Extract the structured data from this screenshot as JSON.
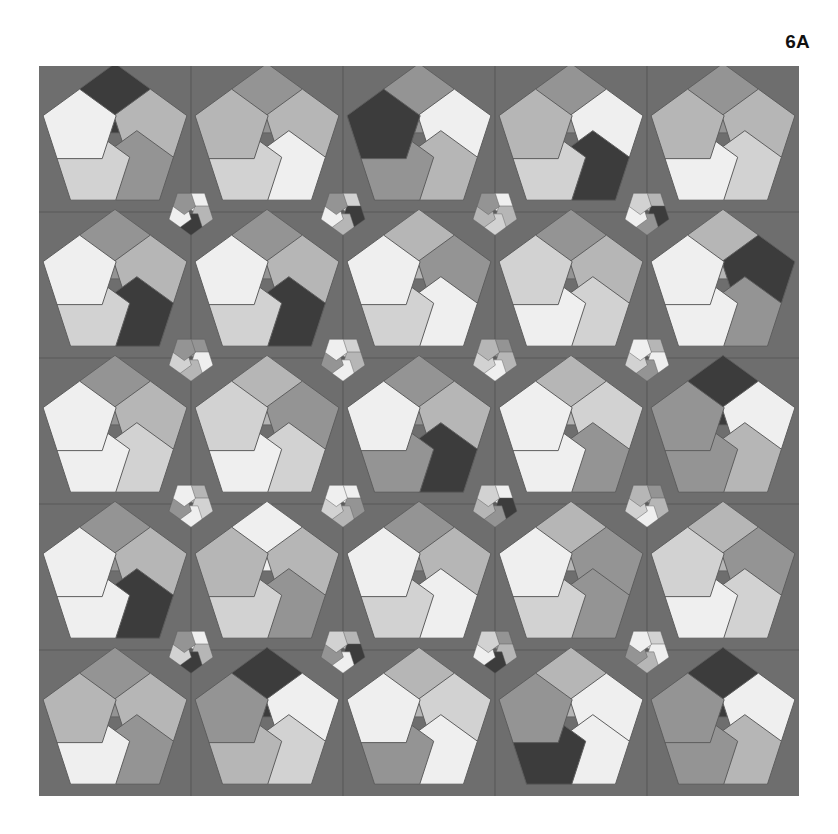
{
  "figure": {
    "label": "6A",
    "title": "6A"
  },
  "canvas": {
    "width": 838,
    "height": 834,
    "page_background": "#ffffff"
  },
  "tiling": {
    "name": "pentagon-rosette-tiling",
    "plate_background": "#6e6e6e",
    "grid_line_color": "#585858",
    "edge_color": "#5d5d5d",
    "origin_x": 39,
    "origin_y": 66,
    "plate_width": 760,
    "plate_height": 730,
    "grid_cols": 5,
    "grid_rows": 5,
    "cell_width": 152,
    "cell_height": 146,
    "large_rosette_radius": 62,
    "small_rosette_radius": 19,
    "pentagons_per_rosette": 5,
    "rosette_angle_step_deg": 72,
    "palette": {
      "near_black": "#3c3c3c",
      "dark_gray": "#7e7e7e",
      "mid_gray": "#949494",
      "light_gray": "#b6b6b6",
      "pale_gray": "#d2d2d2",
      "near_white": "#efefef"
    },
    "color_keys": [
      "near_black",
      "dark_gray",
      "mid_gray",
      "light_gray",
      "pale_gray",
      "near_white"
    ],
    "large_rosettes": [
      {
        "row": 0,
        "col": 0,
        "rotation": 0,
        "colors": [
          "near_black",
          "light_gray",
          "mid_gray",
          "pale_gray",
          "near_white"
        ]
      },
      {
        "row": 0,
        "col": 1,
        "rotation": 0,
        "colors": [
          "mid_gray",
          "light_gray",
          "near_white",
          "pale_gray",
          "light_gray"
        ]
      },
      {
        "row": 0,
        "col": 2,
        "rotation": 0,
        "colors": [
          "mid_gray",
          "near_white",
          "light_gray",
          "mid_gray",
          "near_black"
        ]
      },
      {
        "row": 0,
        "col": 3,
        "rotation": 0,
        "colors": [
          "mid_gray",
          "near_white",
          "near_black",
          "pale_gray",
          "light_gray"
        ]
      },
      {
        "row": 0,
        "col": 4,
        "rotation": 0,
        "colors": [
          "mid_gray",
          "light_gray",
          "pale_gray",
          "near_white",
          "light_gray"
        ]
      },
      {
        "row": 1,
        "col": 0,
        "rotation": 0,
        "colors": [
          "mid_gray",
          "light_gray",
          "near_black",
          "pale_gray",
          "near_white"
        ]
      },
      {
        "row": 1,
        "col": 1,
        "rotation": 0,
        "colors": [
          "mid_gray",
          "light_gray",
          "near_black",
          "pale_gray",
          "near_white"
        ]
      },
      {
        "row": 1,
        "col": 2,
        "rotation": 0,
        "colors": [
          "light_gray",
          "mid_gray",
          "near_white",
          "pale_gray",
          "near_white"
        ]
      },
      {
        "row": 1,
        "col": 3,
        "rotation": 0,
        "colors": [
          "mid_gray",
          "light_gray",
          "pale_gray",
          "near_white",
          "pale_gray"
        ]
      },
      {
        "row": 1,
        "col": 4,
        "rotation": 0,
        "colors": [
          "light_gray",
          "near_black",
          "mid_gray",
          "near_white",
          "near_white"
        ]
      },
      {
        "row": 2,
        "col": 0,
        "rotation": 0,
        "colors": [
          "mid_gray",
          "light_gray",
          "pale_gray",
          "near_white",
          "near_white"
        ]
      },
      {
        "row": 2,
        "col": 1,
        "rotation": 0,
        "colors": [
          "light_gray",
          "mid_gray",
          "pale_gray",
          "near_white",
          "pale_gray"
        ]
      },
      {
        "row": 2,
        "col": 2,
        "rotation": 0,
        "colors": [
          "mid_gray",
          "light_gray",
          "near_black",
          "mid_gray",
          "near_white"
        ]
      },
      {
        "row": 2,
        "col": 3,
        "rotation": 0,
        "colors": [
          "light_gray",
          "pale_gray",
          "mid_gray",
          "near_white",
          "near_white"
        ]
      },
      {
        "row": 2,
        "col": 4,
        "rotation": 0,
        "colors": [
          "near_black",
          "near_white",
          "light_gray",
          "mid_gray",
          "mid_gray"
        ]
      },
      {
        "row": 3,
        "col": 0,
        "rotation": 0,
        "colors": [
          "mid_gray",
          "light_gray",
          "near_black",
          "near_white",
          "near_white"
        ]
      },
      {
        "row": 3,
        "col": 1,
        "rotation": 0,
        "colors": [
          "near_white",
          "light_gray",
          "mid_gray",
          "pale_gray",
          "light_gray"
        ]
      },
      {
        "row": 3,
        "col": 2,
        "rotation": 0,
        "colors": [
          "mid_gray",
          "light_gray",
          "near_white",
          "pale_gray",
          "near_white"
        ]
      },
      {
        "row": 3,
        "col": 3,
        "rotation": 0,
        "colors": [
          "light_gray",
          "mid_gray",
          "mid_gray",
          "pale_gray",
          "near_white"
        ]
      },
      {
        "row": 3,
        "col": 4,
        "rotation": 0,
        "colors": [
          "light_gray",
          "mid_gray",
          "pale_gray",
          "near_white",
          "pale_gray"
        ]
      },
      {
        "row": 4,
        "col": 0,
        "rotation": 0,
        "colors": [
          "mid_gray",
          "light_gray",
          "mid_gray",
          "near_white",
          "light_gray"
        ]
      },
      {
        "row": 4,
        "col": 1,
        "rotation": 0,
        "colors": [
          "near_black",
          "near_white",
          "pale_gray",
          "light_gray",
          "mid_gray"
        ]
      },
      {
        "row": 4,
        "col": 2,
        "rotation": 0,
        "colors": [
          "light_gray",
          "pale_gray",
          "near_white",
          "mid_gray",
          "near_white"
        ]
      },
      {
        "row": 4,
        "col": 3,
        "rotation": 0,
        "colors": [
          "light_gray",
          "near_white",
          "near_white",
          "near_black",
          "mid_gray"
        ]
      },
      {
        "row": 4,
        "col": 4,
        "rotation": 0,
        "colors": [
          "near_black",
          "near_white",
          "light_gray",
          "mid_gray",
          "mid_gray"
        ]
      }
    ],
    "small_rosettes": [
      {
        "row": 0,
        "col": 0,
        "rotation": 36,
        "colors": [
          "near_white",
          "light_gray",
          "near_black",
          "near_white",
          "mid_gray"
        ]
      },
      {
        "row": 0,
        "col": 1,
        "rotation": 36,
        "colors": [
          "pale_gray",
          "near_black",
          "light_gray",
          "near_white",
          "mid_gray"
        ]
      },
      {
        "row": 0,
        "col": 2,
        "rotation": 36,
        "colors": [
          "near_white",
          "light_gray",
          "pale_gray",
          "light_gray",
          "mid_gray"
        ]
      },
      {
        "row": 0,
        "col": 3,
        "rotation": 36,
        "colors": [
          "light_gray",
          "near_black",
          "mid_gray",
          "near_white",
          "pale_gray"
        ]
      },
      {
        "row": 1,
        "col": 0,
        "rotation": 36,
        "colors": [
          "mid_gray",
          "near_white",
          "light_gray",
          "pale_gray",
          "mid_gray"
        ]
      },
      {
        "row": 1,
        "col": 1,
        "rotation": 36,
        "colors": [
          "pale_gray",
          "light_gray",
          "near_white",
          "mid_gray",
          "near_white"
        ]
      },
      {
        "row": 1,
        "col": 2,
        "rotation": 36,
        "colors": [
          "mid_gray",
          "light_gray",
          "near_white",
          "pale_gray",
          "light_gray"
        ]
      },
      {
        "row": 1,
        "col": 3,
        "rotation": 36,
        "colors": [
          "light_gray",
          "near_white",
          "mid_gray",
          "pale_gray",
          "near_white"
        ]
      },
      {
        "row": 2,
        "col": 0,
        "rotation": 36,
        "colors": [
          "light_gray",
          "pale_gray",
          "near_white",
          "mid_gray",
          "near_white"
        ]
      },
      {
        "row": 2,
        "col": 1,
        "rotation": 36,
        "colors": [
          "near_white",
          "mid_gray",
          "light_gray",
          "pale_gray",
          "near_white"
        ]
      },
      {
        "row": 2,
        "col": 2,
        "rotation": 36,
        "colors": [
          "near_white",
          "near_black",
          "mid_gray",
          "light_gray",
          "pale_gray"
        ]
      },
      {
        "row": 2,
        "col": 3,
        "rotation": 36,
        "colors": [
          "mid_gray",
          "light_gray",
          "near_white",
          "pale_gray",
          "light_gray"
        ]
      },
      {
        "row": 3,
        "col": 0,
        "rotation": 36,
        "colors": [
          "near_white",
          "light_gray",
          "near_black",
          "pale_gray",
          "mid_gray"
        ]
      },
      {
        "row": 3,
        "col": 1,
        "rotation": 36,
        "colors": [
          "light_gray",
          "near_black",
          "near_white",
          "mid_gray",
          "pale_gray"
        ]
      },
      {
        "row": 3,
        "col": 2,
        "rotation": 36,
        "colors": [
          "mid_gray",
          "light_gray",
          "near_black",
          "near_white",
          "pale_gray"
        ]
      },
      {
        "row": 3,
        "col": 3,
        "rotation": 36,
        "colors": [
          "pale_gray",
          "near_white",
          "light_gray",
          "mid_gray",
          "near_white"
        ]
      }
    ]
  }
}
